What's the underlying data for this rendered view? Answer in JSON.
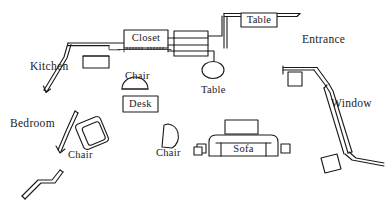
{
  "diagram": {
    "kind": "architectural-floor-plan",
    "stroke_color": "#1a1a1a",
    "fill_color": "#ffffff",
    "background": "#ffffff",
    "width": 386,
    "height": 211
  },
  "rooms": [
    {
      "id": "kitchen",
      "label": "Kitchen",
      "x": 30,
      "y": 61
    },
    {
      "id": "bedroom",
      "label": "Bedroom",
      "x": 10,
      "y": 118
    },
    {
      "id": "entrance",
      "label": "Entrance",
      "x": 302,
      "y": 34
    },
    {
      "id": "window",
      "label": "Window",
      "x": 331,
      "y": 98
    }
  ],
  "furniture": [
    {
      "id": "closet",
      "label": "Closet",
      "shape": "rect-boxed-label",
      "x": 124,
      "y": 30,
      "w": 44,
      "h": 18
    },
    {
      "id": "table-top",
      "label": "Table",
      "shape": "rect-boxed-label",
      "x": 241,
      "y": 13,
      "w": 36,
      "h": 14
    },
    {
      "id": "desk",
      "label": "Desk",
      "shape": "rect-boxed-label",
      "x": 123,
      "y": 96,
      "w": 35,
      "h": 16
    },
    {
      "id": "sofa",
      "label": "Sofa",
      "shape": "rounded-sofa",
      "x": 209,
      "y": 135,
      "w": 69,
      "h": 21
    },
    {
      "id": "chair-desk",
      "label": "Chair",
      "shape": "half-dome",
      "x": 125,
      "y": 71
    },
    {
      "id": "chair-bedroom",
      "label": "Chair",
      "shape": "rotated-armchair",
      "x": 68,
      "y": 150
    },
    {
      "id": "chair-center",
      "label": "Chair",
      "shape": "d-shape",
      "x": 156,
      "y": 148
    },
    {
      "id": "table-round",
      "label": "Table",
      "shape": "ellipse",
      "x": 201,
      "y": 85
    },
    {
      "id": "shelf-unit",
      "label": "",
      "shape": "rect-divided",
      "x": 174,
      "y": 31,
      "w": 34,
      "h": 25
    },
    {
      "id": "counter-left",
      "label": "",
      "shape": "rect-plain",
      "x": 83,
      "y": 56,
      "w": 26,
      "h": 12
    },
    {
      "id": "side-table-left",
      "label": "",
      "shape": "small-square",
      "x": 197,
      "y": 144,
      "w": 9,
      "h": 9
    },
    {
      "id": "side-table-right",
      "label": "",
      "shape": "small-square",
      "x": 281,
      "y": 144,
      "w": 9,
      "h": 9
    },
    {
      "id": "table-back-sofa",
      "label": "",
      "shape": "rect-plain",
      "x": 225,
      "y": 120,
      "w": 33,
      "h": 14
    },
    {
      "id": "entry-square",
      "label": "",
      "shape": "small-square",
      "x": 288,
      "y": 72,
      "w": 14,
      "h": 14
    },
    {
      "id": "corner-square",
      "label": "",
      "shape": "rotated-square",
      "x": 318,
      "y": 155,
      "w": 17,
      "h": 17
    }
  ],
  "walls": [
    {
      "id": "wall-kitchen-top",
      "type": "single-line"
    },
    {
      "id": "wall-kitchen-door",
      "type": "double-line-swing"
    },
    {
      "id": "wall-bedroom-door",
      "type": "double-line-swing"
    },
    {
      "id": "wall-lower-left",
      "type": "double-line-jog"
    },
    {
      "id": "wall-entrance-top",
      "type": "double-line-corner"
    },
    {
      "id": "wall-window",
      "type": "double-line-diagonal"
    },
    {
      "id": "wall-closet-opening",
      "type": "hatched-threshold"
    }
  ]
}
